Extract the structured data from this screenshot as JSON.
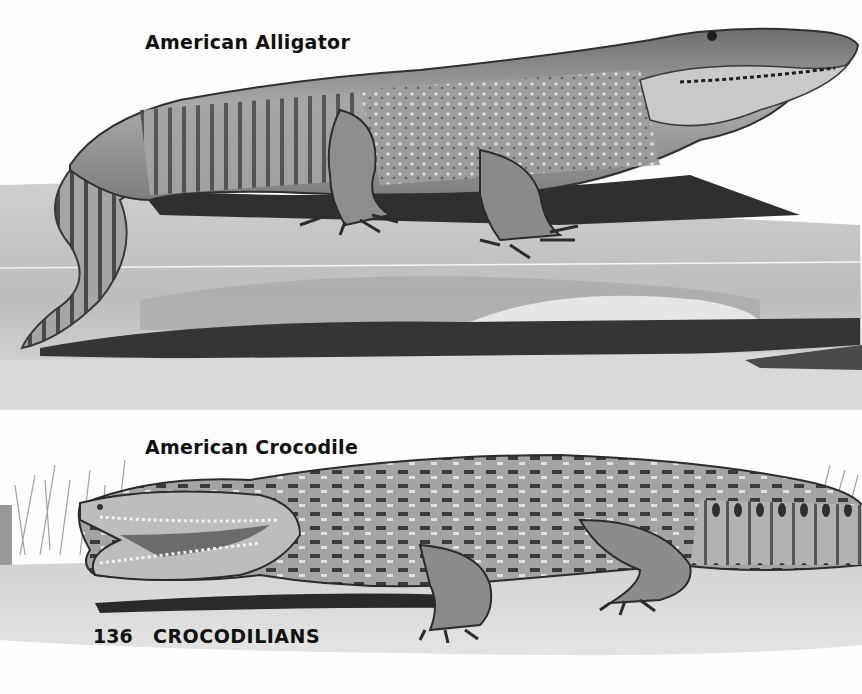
{
  "page": {
    "number": "136",
    "section_title": "CROCODILIANS"
  },
  "illustrations": [
    {
      "caption": "American Alligator"
    },
    {
      "caption": "American Crocodile"
    }
  ],
  "colors": {
    "paper": "#fdfdfd",
    "ink": "#111111",
    "ground_light": "#d8d8d8",
    "ground_mid": "#bdbdbd",
    "shadow": "#3a3a3a",
    "body_mid": "#9a9a9a"
  }
}
